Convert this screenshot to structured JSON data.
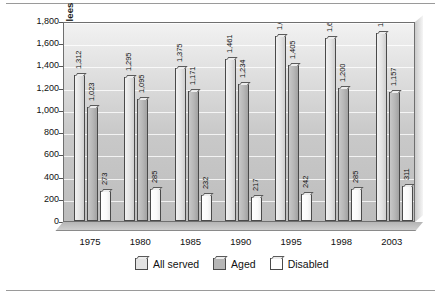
{
  "chart_data": {
    "type": "bar",
    "title": "",
    "xlabel": "",
    "ylabel": "Thousands of Enrollees",
    "categories": [
      "1975",
      "1980",
      "1985",
      "1990",
      "1995",
      "1998",
      "2003"
    ],
    "series": [
      {
        "name": "All served",
        "color": "#e3e3e3",
        "values": [
          1312,
          1295,
          1375,
          1461,
          1667,
          1646,
          1691
        ],
        "labels": [
          "1,312",
          "1,295",
          "1,375",
          "1,461",
          "1,667",
          "1,646",
          "1,691"
        ]
      },
      {
        "name": "Aged",
        "color": "#b6b6b6",
        "values": [
          1023,
          1095,
          1171,
          1234,
          1405,
          1200,
          1157
        ],
        "labels": [
          "1,023",
          "1,095",
          "1,171",
          "1,234",
          "1,405",
          "1,200",
          "1,157"
        ]
      },
      {
        "name": "Disabled",
        "color": "#ffffff",
        "values": [
          273,
          285,
          232,
          217,
          242,
          285,
          311
        ],
        "labels": [
          "273",
          "285",
          "232",
          "217",
          "242",
          "285",
          "311"
        ]
      }
    ],
    "ylim": [
      0,
      1800
    ],
    "yticks": [
      0,
      200,
      400,
      600,
      800,
      1000,
      1200,
      1400,
      1600,
      1800
    ],
    "ytick_labels": [
      "0",
      "200",
      "400",
      "600",
      "800",
      "1,000",
      "1,200",
      "1,400",
      "1,600",
      "1,800"
    ],
    "grid": true,
    "legend_position": "bottom"
  },
  "legend": {
    "items": [
      {
        "label": "All served",
        "swatch": "legend-swatch-all-served"
      },
      {
        "label": "Aged",
        "swatch": "legend-swatch-aged"
      },
      {
        "label": "Disabled",
        "swatch": "legend-swatch-disabled"
      }
    ]
  }
}
